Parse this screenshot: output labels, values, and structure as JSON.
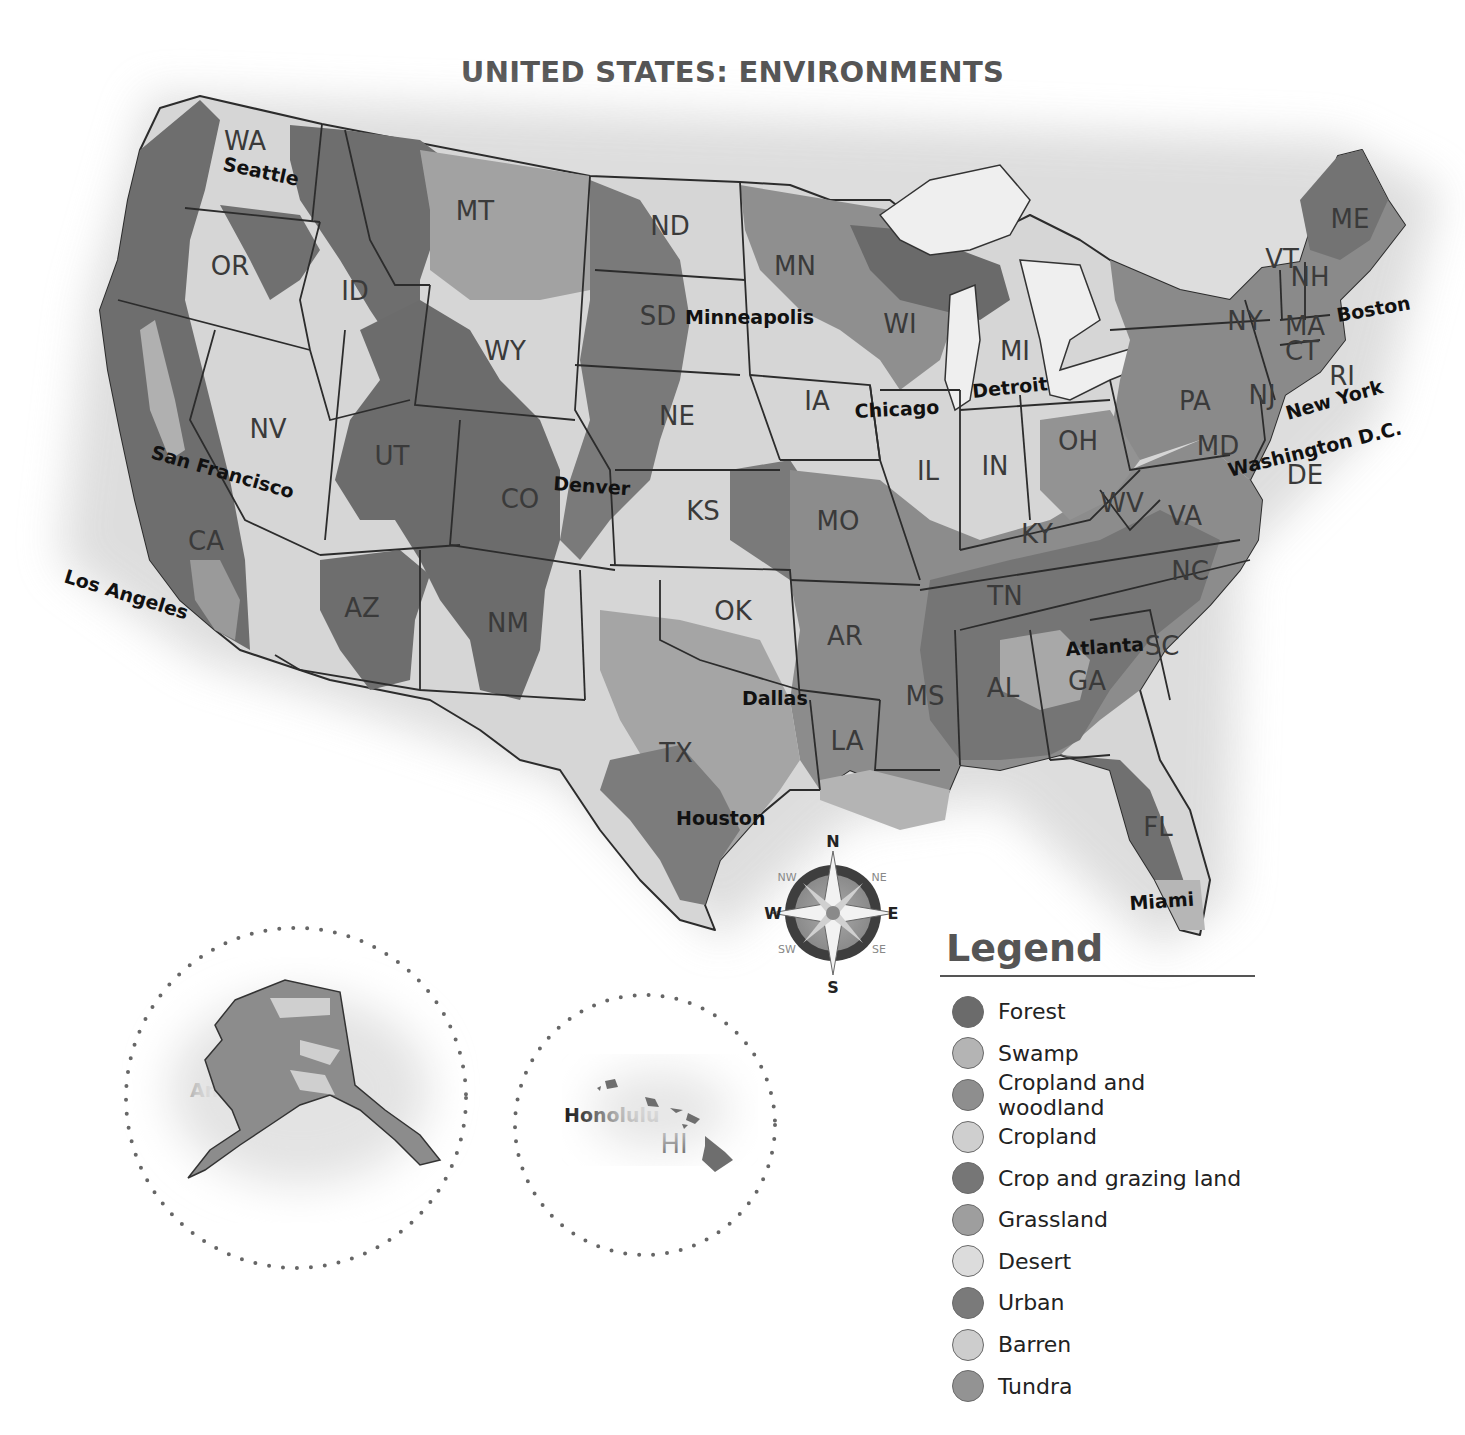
{
  "map": {
    "title": "UNITED STATES: ENVIRONMENTS",
    "states": [
      {
        "abbr": "WA",
        "x": 245,
        "y": 150
      },
      {
        "abbr": "OR",
        "x": 230,
        "y": 275
      },
      {
        "abbr": "ID",
        "x": 355,
        "y": 300
      },
      {
        "abbr": "MT",
        "x": 475,
        "y": 220
      },
      {
        "abbr": "ND",
        "x": 670,
        "y": 235
      },
      {
        "abbr": "SD",
        "x": 658,
        "y": 325
      },
      {
        "abbr": "MN",
        "x": 795,
        "y": 275
      },
      {
        "abbr": "WI",
        "x": 900,
        "y": 333
      },
      {
        "abbr": "MI",
        "x": 1015,
        "y": 360
      },
      {
        "abbr": "WY",
        "x": 505,
        "y": 360
      },
      {
        "abbr": "NV",
        "x": 268,
        "y": 438
      },
      {
        "abbr": "UT",
        "x": 392,
        "y": 465
      },
      {
        "abbr": "CO",
        "x": 520,
        "y": 508
      },
      {
        "abbr": "NE",
        "x": 677,
        "y": 425
      },
      {
        "abbr": "IA",
        "x": 817,
        "y": 410
      },
      {
        "abbr": "IL",
        "x": 928,
        "y": 480
      },
      {
        "abbr": "IN",
        "x": 995,
        "y": 475
      },
      {
        "abbr": "OH",
        "x": 1078,
        "y": 450
      },
      {
        "abbr": "PA",
        "x": 1195,
        "y": 410
      },
      {
        "abbr": "NY",
        "x": 1245,
        "y": 330
      },
      {
        "abbr": "VT",
        "x": 1282,
        "y": 268
      },
      {
        "abbr": "NH",
        "x": 1310,
        "y": 286
      },
      {
        "abbr": "ME",
        "x": 1350,
        "y": 228
      },
      {
        "abbr": "MA",
        "x": 1305,
        "y": 335
      },
      {
        "abbr": "CT",
        "x": 1302,
        "y": 360
      },
      {
        "abbr": "RI",
        "x": 1342,
        "y": 385
      },
      {
        "abbr": "NJ",
        "x": 1262,
        "y": 404
      },
      {
        "abbr": "MD",
        "x": 1218,
        "y": 455
      },
      {
        "abbr": "DE",
        "x": 1305,
        "y": 484
      },
      {
        "abbr": "CA",
        "x": 206,
        "y": 550
      },
      {
        "abbr": "AZ",
        "x": 362,
        "y": 617
      },
      {
        "abbr": "NM",
        "x": 508,
        "y": 632
      },
      {
        "abbr": "KS",
        "x": 703,
        "y": 520
      },
      {
        "abbr": "MO",
        "x": 838,
        "y": 530
      },
      {
        "abbr": "KY",
        "x": 1037,
        "y": 543
      },
      {
        "abbr": "WV",
        "x": 1122,
        "y": 512
      },
      {
        "abbr": "VA",
        "x": 1185,
        "y": 525
      },
      {
        "abbr": "OK",
        "x": 733,
        "y": 620
      },
      {
        "abbr": "AR",
        "x": 845,
        "y": 645
      },
      {
        "abbr": "TN",
        "x": 1005,
        "y": 605
      },
      {
        "abbr": "NC",
        "x": 1190,
        "y": 580
      },
      {
        "abbr": "SC",
        "x": 1162,
        "y": 655
      },
      {
        "abbr": "MS",
        "x": 925,
        "y": 705
      },
      {
        "abbr": "AL",
        "x": 1003,
        "y": 697
      },
      {
        "abbr": "GA",
        "x": 1087,
        "y": 690
      },
      {
        "abbr": "TX",
        "x": 676,
        "y": 762
      },
      {
        "abbr": "LA",
        "x": 847,
        "y": 750
      },
      {
        "abbr": "FL",
        "x": 1158,
        "y": 836
      },
      {
        "abbr": "AK",
        "x": 302,
        "y": 1058
      },
      {
        "abbr": "HI",
        "x": 674,
        "y": 1153
      }
    ],
    "cities": [
      {
        "name": "Seattle",
        "x": 222,
        "y": 170,
        "rotate": 12
      },
      {
        "name": "Minneapolis",
        "x": 685,
        "y": 324,
        "rotate": 0
      },
      {
        "name": "Chicago",
        "x": 855,
        "y": 418,
        "rotate": -3
      },
      {
        "name": "Detroit",
        "x": 973,
        "y": 398,
        "rotate": -6
      },
      {
        "name": "Boston",
        "x": 1338,
        "y": 322,
        "rotate": -10
      },
      {
        "name": "New York",
        "x": 1288,
        "y": 420,
        "rotate": -16
      },
      {
        "name": "Washington D.C.",
        "x": 1230,
        "y": 477,
        "rotate": -14
      },
      {
        "name": "San Francisco",
        "x": 150,
        "y": 458,
        "rotate": 16
      },
      {
        "name": "Denver",
        "x": 553,
        "y": 490,
        "rotate": 4
      },
      {
        "name": "Los Angeles",
        "x": 63,
        "y": 582,
        "rotate": 17
      },
      {
        "name": "Dallas",
        "x": 742,
        "y": 705,
        "rotate": 0
      },
      {
        "name": "Atlanta",
        "x": 1066,
        "y": 656,
        "rotate": -4
      },
      {
        "name": "Houston",
        "x": 676,
        "y": 825,
        "rotate": 0
      },
      {
        "name": "Miami",
        "x": 1130,
        "y": 910,
        "rotate": -4
      },
      {
        "name": "Anchorage",
        "x": 190,
        "y": 1097,
        "rotate": 0
      },
      {
        "name": "Honolulu",
        "x": 564,
        "y": 1122,
        "rotate": 0
      }
    ],
    "compass": {
      "n": "N",
      "s": "S",
      "e": "E",
      "w": "W",
      "ne": "NE",
      "nw": "NW",
      "se": "SE",
      "sw": "SW"
    }
  },
  "legend": {
    "title": "Legend",
    "items": [
      {
        "label": "Forest",
        "color": "#6b6b6b"
      },
      {
        "label": "Swamp",
        "color": "#b4b4b4"
      },
      {
        "label": "Cropland and woodland",
        "color": "#8e8e8e"
      },
      {
        "label": "Cropland",
        "color": "#cfcfcf"
      },
      {
        "label": "Crop and grazing land",
        "color": "#767676"
      },
      {
        "label": "Grassland",
        "color": "#9e9e9e"
      },
      {
        "label": "Desert",
        "color": "#dcdcdc"
      },
      {
        "label": "Urban",
        "color": "#7a7a7a"
      },
      {
        "label": "Barren",
        "color": "#cdcdcd"
      },
      {
        "label": "Tundra",
        "color": "#939393"
      }
    ]
  }
}
